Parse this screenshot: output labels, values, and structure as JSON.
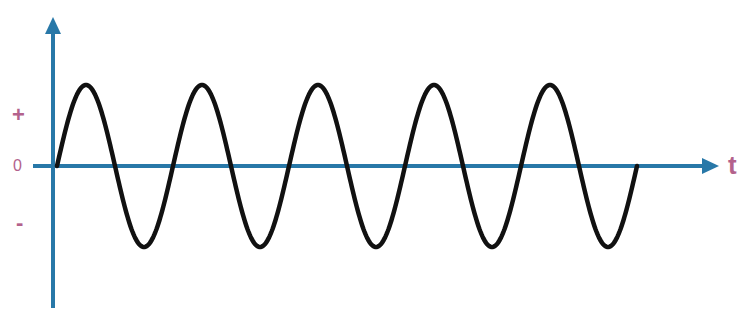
{
  "diagram": {
    "type": "alternating-current-sine-wave",
    "labels": {
      "positive": "+",
      "zero": "0",
      "negative": "-",
      "time_axis": "t"
    },
    "colors": {
      "axis": "#2878a8",
      "labels": "#b3628c",
      "wave": "#111111"
    },
    "wave": {
      "cycles": 5,
      "start": "zero, rising",
      "end": "zero, rising"
    }
  }
}
